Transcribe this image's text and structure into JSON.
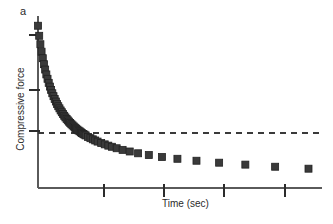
{
  "figure": {
    "panel_label": "a",
    "background_color": "#ffffff"
  },
  "chart_data": {
    "type": "scatter",
    "title": "",
    "subtitle": "",
    "panel": "a",
    "xlabel": "Time (sec)",
    "ylabel": "Compressive force",
    "grid": false,
    "legend": null,
    "legend_position": "none",
    "marker": {
      "shape": "square",
      "color": "#3a3a3a",
      "edge_color": "#222222",
      "size_px": 7
    },
    "axis": {
      "color": "#5a5a5a",
      "x_axis_y_px": 188,
      "y_axis_x_px": 38,
      "x_range_px": [
        38,
        322
      ],
      "y_range_px": [
        16,
        188
      ],
      "x_tick_positions_px": [
        104,
        164,
        224,
        285
      ],
      "y_tick_positions_px": [
        35,
        90,
        131
      ],
      "x_tick_labels": [
        "",
        "",
        "",
        ""
      ],
      "y_tick_labels": [
        "",
        "",
        ""
      ],
      "tick_direction": "out",
      "tick_length_px": 9,
      "axis_note": "Unlabeled arbitrary units on both axes"
    },
    "annotations": [
      {
        "name": "equilibrium-asymptote",
        "type": "horizontal-dashed-line",
        "y_value": 0.04,
        "y_px": 133,
        "x_start_px": 38,
        "x_end_px": 322,
        "color": "#3a3a3a",
        "dash": "6 5",
        "description": "Dashed line marking the equilibrium (residual) compressive force"
      }
    ],
    "x": [
      0.0,
      0.6,
      1.2,
      1.8,
      2.4,
      3.0,
      3.6,
      4.2,
      4.8,
      5.4,
      6.0,
      6.6,
      7.2,
      7.8,
      8.4,
      9.0,
      9.6,
      10.2,
      10.8,
      11.4,
      12.0,
      12.6,
      13.2,
      13.8,
      14.4,
      15.0,
      15.6,
      16.2,
      16.8,
      17.4,
      18.0,
      18.6,
      19.2,
      19.8,
      20.4,
      21.0,
      21.6,
      22.2,
      22.8,
      23.4,
      24.0,
      25.2,
      26.4,
      27.6,
      28.8,
      30.0,
      31.8,
      33.6,
      35.4,
      37.2,
      39.6,
      42.6,
      46.2,
      50.4,
      55.8,
      62.4,
      70.2,
      79.8,
      91.2,
      104.4,
      119.4,
      136.2
    ],
    "y": [
      1.0,
      0.938,
      0.886,
      0.84,
      0.8,
      0.763,
      0.73,
      0.7,
      0.673,
      0.648,
      0.625,
      0.604,
      0.584,
      0.566,
      0.549,
      0.533,
      0.518,
      0.504,
      0.491,
      0.478,
      0.467,
      0.456,
      0.445,
      0.435,
      0.426,
      0.417,
      0.409,
      0.401,
      0.393,
      0.386,
      0.379,
      0.372,
      0.366,
      0.36,
      0.354,
      0.349,
      0.343,
      0.338,
      0.333,
      0.329,
      0.324,
      0.315,
      0.307,
      0.3,
      0.293,
      0.286,
      0.277,
      0.269,
      0.261,
      0.254,
      0.245,
      0.235,
      0.225,
      0.214,
      0.203,
      0.191,
      0.18,
      0.168,
      0.156,
      0.144,
      0.131,
      0.119
    ],
    "ylim": [
      0.0,
      1.06
    ],
    "xlim": [
      0.0,
      143.0
    ],
    "series_name": "compressive force relaxation"
  }
}
